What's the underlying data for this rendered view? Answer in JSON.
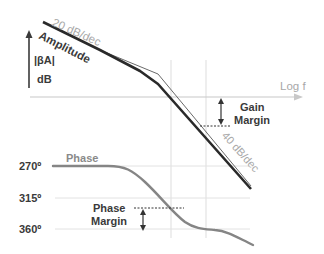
{
  "diagram": {
    "colors": {
      "amplitude_line": "#2a2a2a",
      "asymptote_line": "#6a6a6a",
      "phase_line": "#858585",
      "grid": "#dddddd",
      "axis": "#c8c8c8",
      "text_dark": "#3a3a3a",
      "text_light": "#a8a8a8"
    },
    "magnitude": {
      "y_axis_label_top": "|βA|",
      "y_axis_label_bottom": "dB",
      "x_axis_label": "Log f",
      "curve_label": "Amplitude",
      "slope_1_label": "20 dB/dec",
      "slope_2_label": "40 dB/dec",
      "gain_margin_label_line1": "Gain",
      "gain_margin_label_line2": "Margin"
    },
    "phase": {
      "curve_label": "Phase",
      "ticks": [
        "270º",
        "315º",
        "360º"
      ],
      "phase_margin_label_line1": "Phase",
      "phase_margin_label_line2": "Margin"
    }
  }
}
